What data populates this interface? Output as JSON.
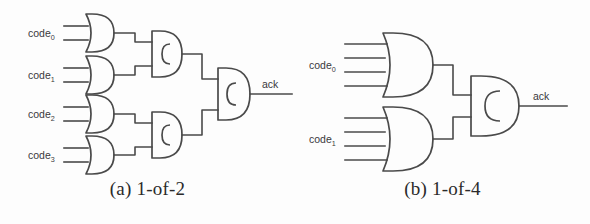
{
  "figure": {
    "background_color": "#fdfdfd",
    "line_color": "#4a4a4a",
    "text_color": "#39393c"
  },
  "panels": [
    {
      "id": "a",
      "caption": "(a) 1-of-2",
      "output_label": "ack",
      "input_labels": [
        "code",
        "code",
        "code",
        "code"
      ],
      "input_subscripts": [
        "0",
        "1",
        "2",
        "3"
      ],
      "or_gate_count": 4,
      "or_gate_inputs": 2,
      "c_element_count": 3,
      "gate_glyph": "C"
    },
    {
      "id": "b",
      "caption": "(b) 1-of-4",
      "output_label": "ack",
      "input_labels": [
        "code",
        "code"
      ],
      "input_subscripts": [
        "0",
        "1"
      ],
      "or_gate_count": 2,
      "or_gate_inputs": 4,
      "c_element_count": 1,
      "gate_glyph": "C"
    }
  ]
}
